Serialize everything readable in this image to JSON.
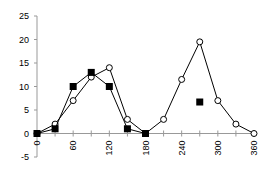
{
  "chart_data": {
    "type": "line",
    "title": "",
    "xlabel": "",
    "ylabel": "",
    "xlim": [
      0,
      360
    ],
    "ylim": [
      -5,
      25
    ],
    "x_ticks": [
      0,
      60,
      120,
      180,
      240,
      300,
      360
    ],
    "x_minor_step": 30,
    "y_ticks": [
      -5,
      0,
      5,
      10,
      15,
      20,
      25
    ],
    "grid": false,
    "legend": null,
    "series": [
      {
        "name": "open-circles",
        "marker": "circle-open",
        "line": true,
        "x": [
          0,
          30,
          60,
          90,
          120,
          150,
          180,
          210,
          240,
          270,
          300,
          330,
          360
        ],
        "values": [
          0,
          2,
          7,
          12,
          14,
          3,
          0,
          3,
          11.5,
          19.5,
          7,
          2,
          0
        ]
      },
      {
        "name": "filled-squares",
        "marker": "square-filled",
        "line": true,
        "line_until_index": 6,
        "x": [
          0,
          30,
          60,
          90,
          120,
          150,
          180,
          270
        ],
        "values": [
          0,
          1,
          10,
          13,
          10,
          1,
          0,
          6.7
        ]
      }
    ]
  }
}
